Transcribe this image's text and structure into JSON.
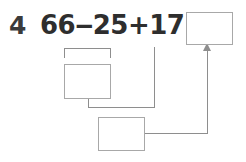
{
  "worksheet": {
    "question_number": "4",
    "expression": "66‒25+17=",
    "expression_parts": {
      "operand_1": "66",
      "operator_1": "−",
      "operand_2": "25",
      "operator_2": "+",
      "operand_3": "17",
      "equals": "="
    },
    "boxes": {
      "answer": "",
      "step_1": "",
      "step_2": ""
    },
    "colors": {
      "ink": "#2e2e2e",
      "box_border": "#a8a8a8",
      "connector": "#8e8e8e",
      "background": "#ffffff"
    }
  }
}
